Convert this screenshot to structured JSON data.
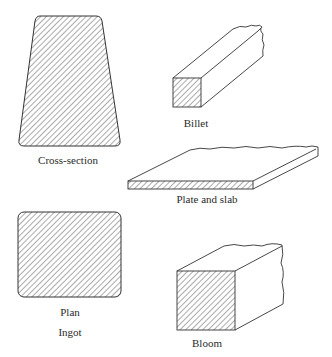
{
  "figure": {
    "shapes": [
      {
        "id": "cross-section",
        "label": "Cross-section",
        "group": "Ingot"
      },
      {
        "id": "plan",
        "label": "Plan",
        "group": "Ingot"
      },
      {
        "id": "billet",
        "label": "Billet"
      },
      {
        "id": "plate",
        "label": "Plate and slab"
      },
      {
        "id": "bloom",
        "label": "Bloom"
      }
    ],
    "group_label": "Ingot"
  },
  "colors": {
    "line": "#333333",
    "background": "#ffffff"
  }
}
